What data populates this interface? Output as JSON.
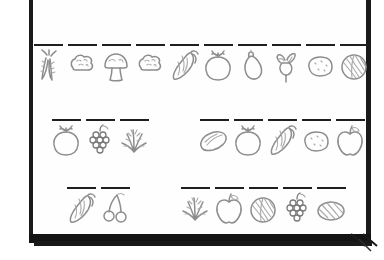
{
  "document": {
    "kind": "worksheet-page-photo",
    "background_color": "#ffffff",
    "page_color": "#fefefe",
    "ink_color": "#1f1f1f",
    "sketch_color": "#8d8d8d",
    "frame_color": "#1a1a1a",
    "has_folded_corner": true,
    "blank_line_count": 25
  },
  "rows": [
    {
      "id": "row-1",
      "groups": [
        {
          "id": "row-1-group-1",
          "cells": [
            {
              "icon": "carrots-icon",
              "label": "",
              "has_blank_line": true
            },
            {
              "icon": "cauliflower-icon",
              "label": "",
              "has_blank_line": true
            },
            {
              "icon": "mushroom-icon",
              "label": "",
              "has_blank_line": true
            },
            {
              "icon": "cauliflower-icon",
              "label": "",
              "has_blank_line": true
            },
            {
              "icon": "corn-icon",
              "label": "",
              "has_blank_line": true
            },
            {
              "icon": "tomato-icon",
              "label": "",
              "has_blank_line": true
            },
            {
              "icon": "pepper-icon",
              "label": "",
              "has_blank_line": true
            },
            {
              "icon": "radish-icon",
              "label": "",
              "has_blank_line": true
            },
            {
              "icon": "potato-icon",
              "label": "",
              "has_blank_line": true
            },
            {
              "icon": "cabbage-icon",
              "label": "",
              "has_blank_line": true
            }
          ]
        }
      ]
    },
    {
      "id": "row-2",
      "groups": [
        {
          "id": "row-2-group-1",
          "cells": [
            {
              "icon": "tomato-icon",
              "label": "",
              "has_blank_line": true
            },
            {
              "icon": "grapes-icon",
              "label": "",
              "has_blank_line": true
            },
            {
              "icon": "herbs-icon",
              "label": "",
              "has_blank_line": true
            }
          ]
        },
        {
          "id": "row-2-group-2",
          "cells": [
            {
              "icon": "cucumber-icon",
              "label": "",
              "has_blank_line": true
            },
            {
              "icon": "tomato-icon",
              "label": "",
              "has_blank_line": true
            },
            {
              "icon": "corn-icon",
              "label": "",
              "has_blank_line": true
            },
            {
              "icon": "potato-icon",
              "label": "",
              "has_blank_line": true
            },
            {
              "icon": "apple-icon",
              "label": "",
              "has_blank_line": true
            }
          ]
        }
      ]
    },
    {
      "id": "row-3",
      "groups": [
        {
          "id": "row-3-group-1",
          "cells": [
            {
              "icon": "corn-icon",
              "label": "",
              "has_blank_line": true
            },
            {
              "icon": "cherries-icon",
              "label": "",
              "has_blank_line": true
            }
          ]
        },
        {
          "id": "row-3-group-2",
          "cells": [
            {
              "icon": "herbs-icon",
              "label": "",
              "has_blank_line": true
            },
            {
              "icon": "apple-icon",
              "label": "",
              "has_blank_line": true
            },
            {
              "icon": "cabbage-icon",
              "label": "",
              "has_blank_line": true
            },
            {
              "icon": "grapes-icon",
              "label": "",
              "has_blank_line": true
            },
            {
              "icon": "melon-icon",
              "label": "",
              "has_blank_line": true
            }
          ]
        }
      ]
    }
  ]
}
